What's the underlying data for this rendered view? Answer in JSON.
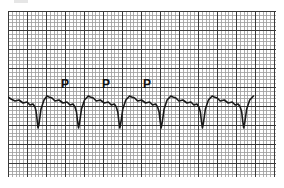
{
  "figure": {
    "type": "ecg-strip",
    "labels": [
      {
        "text": "P",
        "x": 61,
        "y": 78
      },
      {
        "text": "P",
        "x": 102,
        "y": 78
      },
      {
        "text": "P",
        "x": 143,
        "y": 78
      }
    ],
    "grid": {
      "minor_spacing_px": 3.8,
      "major_every": 5,
      "minor_color": "#9a9a9a",
      "major_color": "#3a3a3a"
    },
    "trace": {
      "color": "#1a1a1a",
      "beat_interval_px": 41.3,
      "beats": 6
    }
  }
}
